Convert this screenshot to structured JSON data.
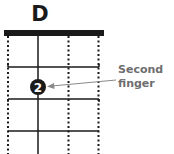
{
  "chord": {
    "name": "D"
  },
  "annotation": {
    "line1": "Second",
    "line2": "finger"
  },
  "finger_dot": {
    "number": "2",
    "string": 2,
    "fret": 2
  },
  "colors": {
    "ink": "#1a1a1a",
    "annotation": "#6e6e6e",
    "background": "#ffffff"
  },
  "strings": [
    {
      "index": 1,
      "style": "dotted"
    },
    {
      "index": 2,
      "style": "solid"
    },
    {
      "index": 3,
      "style": "dotted"
    },
    {
      "index": 4,
      "style": "dotted"
    }
  ]
}
